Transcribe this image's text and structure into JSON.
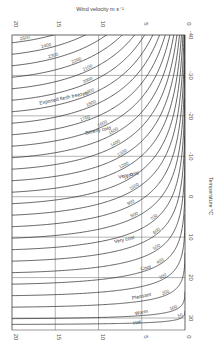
{
  "chart_data": {
    "type": "line",
    "xlabel": "Wind velocity m s⁻¹",
    "ylabel": "Temperature °C",
    "x_ticks": [
      20,
      15,
      10,
      5,
      0
    ],
    "y_ticks": [
      -40,
      -30,
      -20,
      -10,
      0,
      10,
      20,
      30
    ],
    "xlim": [
      20,
      0
    ],
    "ylim": [
      -40,
      33
    ],
    "grid": true,
    "orientation": "rotated 90 degrees (wind velocity along top/bottom, temperature on right)",
    "series_description": "Iso-lines of wind chill cooling power",
    "series": [
      {
        "name": "2500",
        "value": 2500
      },
      {
        "name": "2400",
        "value": 2400
      },
      {
        "name": "2300",
        "value": 2300
      },
      {
        "name": "2200",
        "value": 2200
      },
      {
        "name": "2100",
        "value": 2100
      },
      {
        "name": "2000",
        "value": 2000
      },
      {
        "name": "1900",
        "value": 1900
      },
      {
        "name": "1800",
        "value": 1800
      },
      {
        "name": "1700",
        "value": 1700
      },
      {
        "name": "1600",
        "value": 1600
      },
      {
        "name": "1500",
        "value": 1500
      },
      {
        "name": "1400",
        "value": 1400
      },
      {
        "name": "1300",
        "value": 1300
      },
      {
        "name": "1200",
        "value": 1200
      },
      {
        "name": "1100",
        "value": 1100
      },
      {
        "name": "1000",
        "value": 1000
      },
      {
        "name": "900",
        "value": 900
      },
      {
        "name": "800",
        "value": 800
      },
      {
        "name": "700",
        "value": 700
      },
      {
        "name": "600",
        "value": 600
      },
      {
        "name": "500",
        "value": 500
      },
      {
        "name": "400",
        "value": 400
      },
      {
        "name": "300",
        "value": 300
      },
      {
        "name": "200",
        "value": 200
      },
      {
        "name": "100",
        "value": 100
      },
      {
        "name": "50",
        "value": 50
      }
    ],
    "zones": [
      {
        "label": "Exposed flesh freezes",
        "wind": 14,
        "temp": -24
      },
      {
        "label": "Bitterly cold",
        "wind": 10,
        "temp": -16
      },
      {
        "label": "Very cold",
        "wind": 6.5,
        "temp": -5
      },
      {
        "label": "Very cool",
        "wind": 7,
        "temp": 11
      },
      {
        "label": "Cool",
        "wind": 4.5,
        "temp": 18
      },
      {
        "label": "Pleasant",
        "wind": 5,
        "temp": 25
      },
      {
        "label": "Warm",
        "wind": 5,
        "temp": 29
      },
      {
        "label": "Hot",
        "wind": 5.5,
        "temp": 31.5
      }
    ],
    "curve_labels": [
      {
        "text": "2500",
        "wind": 18.5
      },
      {
        "text": "2400",
        "wind": 16
      },
      {
        "text": "2300",
        "wind": 15.2
      },
      {
        "text": "2200",
        "wind": 12.5
      },
      {
        "text": "2100",
        "wind": 11.2
      },
      {
        "text": "2000",
        "wind": 11.2
      },
      {
        "text": "1900",
        "wind": 11
      },
      {
        "text": "1800",
        "wind": 10.8
      },
      {
        "text": "1700",
        "wind": 11.5
      },
      {
        "text": "1600",
        "wind": 9.5
      },
      {
        "text": "1500",
        "wind": 8.2
      },
      {
        "text": "1400",
        "wind": 8
      },
      {
        "text": "1300",
        "wind": 7.2
      },
      {
        "text": "1200",
        "wind": 7
      },
      {
        "text": "1100",
        "wind": 6.5
      },
      {
        "text": "1000",
        "wind": 5.8
      },
      {
        "text": "900",
        "wind": 6.2
      },
      {
        "text": "800",
        "wind": 5.8
      },
      {
        "text": "700",
        "wind": 3.5
      },
      {
        "text": "600",
        "wind": 3.2
      },
      {
        "text": "500",
        "wind": 3.2
      },
      {
        "text": "400",
        "wind": 2.8
      },
      {
        "text": "300",
        "wind": 2.5
      },
      {
        "text": "200",
        "wind": 2.2
      },
      {
        "text": "100",
        "wind": 1.3
      },
      {
        "text": "50",
        "wind": 0.5
      }
    ]
  }
}
